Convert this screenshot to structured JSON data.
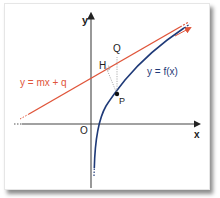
{
  "diagram": {
    "axes": {
      "x_label": "x",
      "y_label": "y",
      "origin_label": "O"
    },
    "line": {
      "label": "y = mx + q",
      "color": "#e0553a"
    },
    "curve": {
      "label": "y = f(x)",
      "color": "#1f3a78"
    },
    "points": {
      "P": "P",
      "Q": "Q",
      "H": "H"
    },
    "colors": {
      "axis": "#333333",
      "construction": "#999999",
      "text": "#222222"
    }
  }
}
